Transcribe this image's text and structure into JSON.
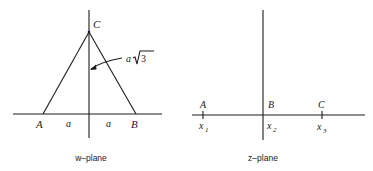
{
  "figure": {
    "left_panel": {
      "caption": "w–plane",
      "vertices": {
        "A": "A",
        "B": "B",
        "C": "C"
      },
      "segment_labels": {
        "left_half": "a",
        "right_half": "a"
      },
      "height_label": {
        "coef": "a",
        "radical": "3"
      }
    },
    "right_panel": {
      "caption": "z–plane",
      "points": [
        {
          "label": "A",
          "coord": "x",
          "sub": "1"
        },
        {
          "label": "B",
          "coord": "x",
          "sub": "2"
        },
        {
          "label": "C",
          "coord": "x",
          "sub": "3"
        }
      ]
    },
    "colors": {
      "ink": "#1c1c1c",
      "background": "#ffffff"
    }
  }
}
